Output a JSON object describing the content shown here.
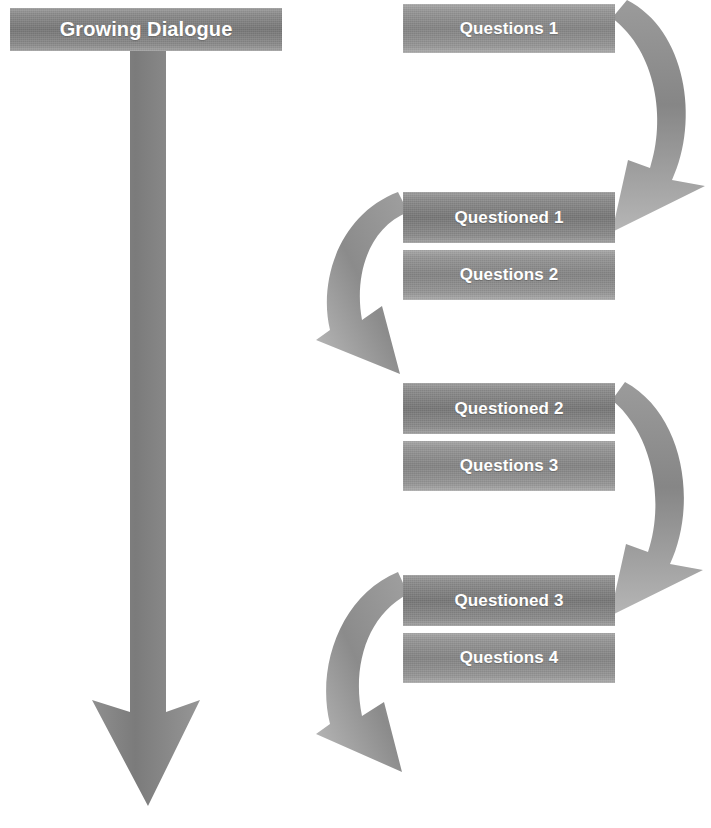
{
  "diagram": {
    "title": "Growing Dialogue",
    "type": "process-flow",
    "colors": {
      "box_fill_dark": "#757575",
      "box_fill_mid": "#828282",
      "arrow_fill": "#8f8f8f",
      "arrow_fill_light": "#b4b4b4",
      "text": "#ffffff",
      "background": "#ffffff"
    },
    "title_box": {
      "label": "Growing Dialogue"
    },
    "main_arrow": {
      "name": "growing-dialogue-down-arrow",
      "direction": "down"
    },
    "steps": [
      {
        "label": "Questions 1",
        "kind": "questions"
      },
      {
        "label": "Questioned 1",
        "kind": "questioned"
      },
      {
        "label": "Questions 2",
        "kind": "questions"
      },
      {
        "label": "Questioned 2",
        "kind": "questioned"
      },
      {
        "label": "Questions 3",
        "kind": "questions"
      },
      {
        "label": "Questioned 3",
        "kind": "questioned"
      },
      {
        "label": "Questions 4",
        "kind": "questions"
      }
    ],
    "connectors": [
      {
        "name": "curve-right-1",
        "side": "right",
        "from": "Questions 1",
        "to": "Questioned 1"
      },
      {
        "name": "curve-left-1",
        "side": "left",
        "from": "Questions 2",
        "to": "Questioned 2"
      },
      {
        "name": "curve-right-2",
        "side": "right",
        "from": "Questions 3",
        "to": "Questioned 3"
      },
      {
        "name": "curve-left-2",
        "side": "left",
        "from": "Questions 4",
        "to": "next"
      }
    ]
  }
}
